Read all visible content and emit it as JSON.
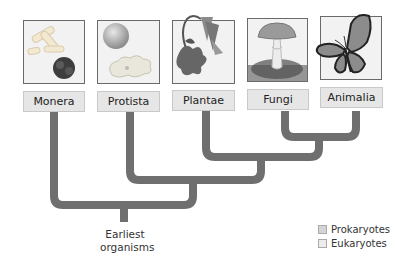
{
  "kingdoms": [
    {
      "name": "Monera",
      "illustration": "bacteria-icon",
      "group": "Prokaryotes"
    },
    {
      "name": "Protista",
      "illustration": "protist-icon",
      "group": "Eukaryotes"
    },
    {
      "name": "Plantae",
      "illustration": "flower-icon",
      "group": "Eukaryotes"
    },
    {
      "name": "Fungi",
      "illustration": "mushroom-icon",
      "group": "Eukaryotes"
    },
    {
      "name": "Animalia",
      "illustration": "butterfly-icon",
      "group": "Eukaryotes"
    }
  ],
  "root": {
    "line1": "Earliest",
    "line2": "organisms"
  },
  "legend": [
    {
      "label": "Prokaryotes",
      "color": "#d4d4d4"
    },
    {
      "label": "Eukaryotes",
      "color": "#ececec"
    }
  ],
  "colors": {
    "branch": "#6f6f6f",
    "label_bg": "#e6e6e6"
  }
}
